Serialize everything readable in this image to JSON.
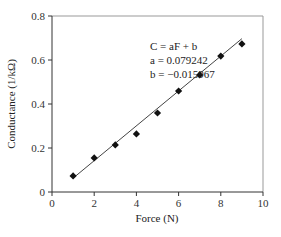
{
  "chart_data": {
    "type": "scatter",
    "title": "",
    "xlabel": "Force (N)",
    "ylabel": "Conductance (1/kΩ)",
    "xlim": [
      0,
      10
    ],
    "ylim": [
      0,
      0.8
    ],
    "x_ticks": [
      "0",
      "2",
      "4",
      "6",
      "8",
      "10"
    ],
    "y_ticks": [
      "0",
      "0.2",
      "0.4",
      "0.6",
      "0.8"
    ],
    "grid": false,
    "legend": null,
    "series": [
      {
        "name": "Measured",
        "marker": "diamond",
        "x": [
          1,
          2,
          3,
          4,
          5,
          6,
          7,
          8,
          9
        ],
        "y": [
          0.073,
          0.155,
          0.214,
          0.264,
          0.359,
          0.459,
          0.532,
          0.618,
          0.673
        ]
      },
      {
        "name": "Linear fit",
        "style": "line",
        "x": [
          1,
          9
        ],
        "y": [
          0.063,
          0.697
        ]
      }
    ],
    "annotations": [
      {
        "text": "C = aF + b"
      },
      {
        "text": "a = 0.079242"
      },
      {
        "text": "b = −0.015967"
      }
    ],
    "fit": {
      "a": 0.079242,
      "b": -0.015967
    }
  },
  "axes": {
    "xlabel": "Force (N)",
    "ylabel": "Conductance (1/kΩ)",
    "x_ticks": [
      "0",
      "2",
      "4",
      "6",
      "8",
      "10"
    ],
    "y_ticks": [
      "0",
      "0.2",
      "0.4",
      "0.6",
      "0.8"
    ]
  },
  "equation": {
    "line1": "C = aF + b",
    "line2": "a = 0.079242",
    "line3": "b = −0.015967"
  }
}
